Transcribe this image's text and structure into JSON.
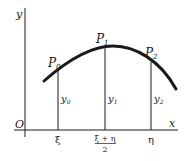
{
  "diagram": {
    "type": "curve-with-ordinates",
    "axes": {
      "x_label": "x",
      "y_label": "y",
      "origin_label": "O"
    },
    "points": [
      {
        "name": "P",
        "sub": "0",
        "ordinate": "y",
        "ordinate_sub": "0",
        "abscissa": "ξ"
      },
      {
        "name": "P",
        "sub": "1",
        "ordinate": "y",
        "ordinate_sub": "1",
        "abscissa_num": "ξ + η",
        "abscissa_den": "2"
      },
      {
        "name": "P",
        "sub": "2",
        "ordinate": "y",
        "ordinate_sub": "2",
        "abscissa": "η"
      }
    ],
    "colors": {
      "line": "#1a1a1a",
      "background": "#ffffff"
    }
  }
}
